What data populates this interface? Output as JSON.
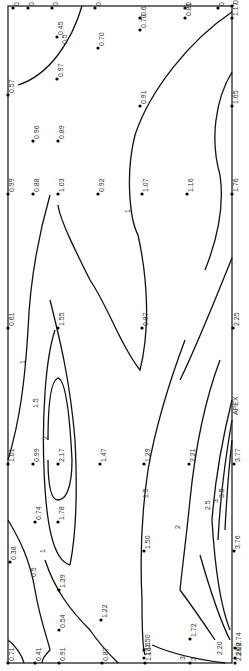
{
  "figure": {
    "type": "contour-map",
    "orientation": "rotated-90",
    "frame": {
      "x1": 8,
      "y1": 6,
      "x2": 232,
      "y2": 663
    },
    "apex_label": "APEX",
    "apex_position": {
      "x": 238,
      "y": 415
    }
  },
  "points": [
    {
      "x": 13,
      "y": 8,
      "v": "0"
    },
    {
      "x": 28,
      "y": 8,
      "v": "0"
    },
    {
      "x": 52,
      "y": 8,
      "v": "0"
    },
    {
      "x": 95,
      "y": 8,
      "v": "0"
    },
    {
      "x": 185,
      "y": 8,
      "v": "0"
    },
    {
      "x": 218,
      "y": 8,
      "v": "0"
    },
    {
      "x": 232,
      "y": 6,
      "v": "0"
    },
    {
      "x": 57,
      "y": 37,
      "v": "0.45"
    },
    {
      "x": 140,
      "y": 18,
      "v": "0.6"
    },
    {
      "x": 140,
      "y": 30,
      "v": "0.70"
    },
    {
      "x": 185,
      "y": 18,
      "v": "0.81"
    },
    {
      "x": 232,
      "y": 18,
      "v": "1.17"
    },
    {
      "x": 98,
      "y": 48,
      "v": "0.70"
    },
    {
      "x": 57,
      "y": 79,
      "v": "0.97"
    },
    {
      "x": 8,
      "y": 95,
      "v": "0.57"
    },
    {
      "x": 140,
      "y": 106,
      "v": "0.91"
    },
    {
      "x": 232,
      "y": 106,
      "v": "1.65"
    },
    {
      "x": 33,
      "y": 141,
      "v": "0.96"
    },
    {
      "x": 58,
      "y": 141,
      "v": "0.89"
    },
    {
      "x": 8,
      "y": 194,
      "v": "0.99"
    },
    {
      "x": 33,
      "y": 194,
      "v": "0.88"
    },
    {
      "x": 58,
      "y": 194,
      "v": "1.03"
    },
    {
      "x": 98,
      "y": 194,
      "v": "0.92"
    },
    {
      "x": 142,
      "y": 194,
      "v": "1.07"
    },
    {
      "x": 187,
      "y": 194,
      "v": "1.16"
    },
    {
      "x": 232,
      "y": 194,
      "v": "1.76"
    },
    {
      "x": 8,
      "y": 328,
      "v": "0.61"
    },
    {
      "x": 58,
      "y": 328,
      "v": "1.55"
    },
    {
      "x": 142,
      "y": 328,
      "v": "0.87"
    },
    {
      "x": 233,
      "y": 328,
      "v": "2.25"
    },
    {
      "x": 8,
      "y": 464,
      "v": "1.01"
    },
    {
      "x": 33,
      "y": 464,
      "v": "0.99"
    },
    {
      "x": 58,
      "y": 464,
      "v": "2.17"
    },
    {
      "x": 100,
      "y": 464,
      "v": "1.47"
    },
    {
      "x": 144,
      "y": 464,
      "v": "1.29"
    },
    {
      "x": 189,
      "y": 464,
      "v": "2.21"
    },
    {
      "x": 234,
      "y": 464,
      "v": "3.77"
    },
    {
      "x": 35,
      "y": 522,
      "v": "0.74"
    },
    {
      "x": 58,
      "y": 522,
      "v": "1.78"
    },
    {
      "x": 144,
      "y": 551,
      "v": "1.50"
    },
    {
      "x": 234,
      "y": 551,
      "v": "3.76"
    },
    {
      "x": 10,
      "y": 562,
      "v": "0.38"
    },
    {
      "x": 59,
      "y": 590,
      "v": "1.39"
    },
    {
      "x": 101,
      "y": 620,
      "v": "1.22"
    },
    {
      "x": 59,
      "y": 630,
      "v": "0.54"
    },
    {
      "x": 190,
      "y": 639,
      "v": "1.72"
    },
    {
      "x": 144,
      "y": 650,
      "v": "1.50"
    },
    {
      "x": 235,
      "y": 648,
      "v": "2.74"
    },
    {
      "x": 144,
      "y": 658,
      "v": "1.16"
    },
    {
      "x": 235,
      "y": 658,
      "v": "2.08"
    },
    {
      "x": 8,
      "y": 663,
      "v": "0.71"
    },
    {
      "x": 35,
      "y": 663,
      "v": "0.41"
    },
    {
      "x": 59,
      "y": 663,
      "v": "0.91"
    },
    {
      "x": 102,
      "y": 663,
      "v": "0.87"
    },
    {
      "x": 145,
      "y": 663,
      "v": "1.16"
    },
    {
      "x": 190,
      "y": 663,
      "v": "3"
    },
    {
      "x": 235,
      "y": 663,
      "v": "2.20"
    }
  ],
  "contour_labels": [
    {
      "x": 67,
      "y": 44,
      "t": "0.5"
    },
    {
      "x": 130,
      "y": 213,
      "t": "1"
    },
    {
      "x": 25,
      "y": 364,
      "t": "1"
    },
    {
      "x": 38,
      "y": 408,
      "t": "1.5"
    },
    {
      "x": 48,
      "y": 440,
      "t": "2"
    },
    {
      "x": 148,
      "y": 498,
      "t": "1.5"
    },
    {
      "x": 180,
      "y": 529,
      "t": "2"
    },
    {
      "x": 210,
      "y": 510,
      "t": "2.5"
    },
    {
      "x": 218,
      "y": 503,
      "t": "3"
    },
    {
      "x": 224,
      "y": 498,
      "t": "3.5"
    },
    {
      "x": 45,
      "y": 553,
      "t": "1"
    },
    {
      "x": 36,
      "y": 577,
      "t": "0.5"
    },
    {
      "x": 185,
      "y": 660,
      "t": "3"
    },
    {
      "x": 222,
      "y": 655,
      "t": "2.20"
    }
  ],
  "contours": [
    {
      "level": "0.5",
      "d": "M 82 6 C 72 40, 50 75, 18 85"
    },
    {
      "level": "1",
      "d": "M 232 12 C 190 40, 150 90, 135 135 C 125 175, 130 220, 138 235 C 148 280, 150 330, 140 370 C 120 345, 110 310, 90 280 C 75 250, 60 220, 58 205"
    },
    {
      "level": "1-b",
      "d": "M 50 195 C 40 230, 30 280, 28 330 C 25 380, 20 420, 8 460"
    },
    {
      "level": "1.5",
      "d": "M 232 72 C 215 100, 210 140, 220 175 C 225 210, 215 245, 205 270"
    },
    {
      "level": "2",
      "d": "M 232 258 C 215 300, 195 350, 180 380"
    },
    {
      "level": "1.5-inner",
      "d": "M 55 330 C 45 360, 42 420, 44 470 C 46 520, 52 560, 70 565"
    },
    {
      "level": "1.5-right",
      "d": "M 50 300 C 60 340, 70 380, 75 440 C 78 500, 75 540, 70 565"
    },
    {
      "level": "2-inner",
      "d": "M 48 440 C 48 400, 52 380, 58 378 C 66 380, 70 420, 72 460 C 72 490, 65 500, 58 500 C 50 500, 48 480, 48 460"
    },
    {
      "level": "1.5-mid",
      "d": "M 185 340 C 170 380, 155 430, 148 470 C 142 510, 140 560, 142 600 C 142 630, 143 650, 145 655"
    },
    {
      "level": "2-mid",
      "d": "M 220 360 C 205 400, 195 450, 190 500 C 186 540, 182 570, 180 590"
    },
    {
      "level": "2.5",
      "d": "M 232 400 C 222 440, 215 480, 212 520"
    },
    {
      "level": "3",
      "d": "M 232 420 C 225 460, 220 500, 218 540"
    },
    {
      "level": "3.5",
      "d": "M 232 440 C 228 475, 226 510, 225 530"
    },
    {
      "level": "0.5-low",
      "d": "M 8 520 C 20 540, 30 560, 35 590 C 40 620, 48 640, 50 650 C 45 655, 42 660, 42 663"
    },
    {
      "level": "1-low",
      "d": "M 45 560 C 55 590, 70 610, 90 630 C 100 645, 110 655, 118 663"
    },
    {
      "level": "0.5-corner",
      "d": "M 8 640 C 15 645, 22 655, 24 663"
    },
    {
      "level": "2-bottom",
      "d": "M 180 590 C 195 610, 205 625, 215 640"
    },
    {
      "level": "2.5-bottom",
      "d": "M 212 520 C 215 570, 222 610, 230 630"
    },
    {
      "level": "3-bottom",
      "d": "M 152 645 C 175 655, 200 660, 225 663"
    },
    {
      "level": "3.5-bottom",
      "d": "M 200 555 C 210 590, 220 620, 230 640"
    }
  ]
}
